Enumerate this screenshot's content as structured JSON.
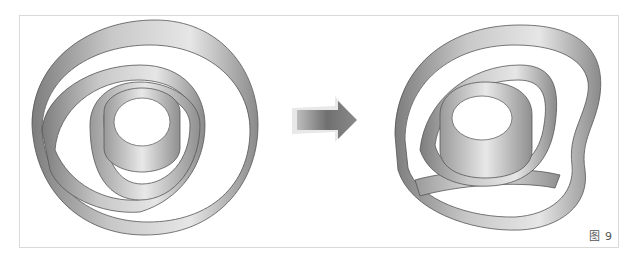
{
  "figure": {
    "caption": "图 9",
    "left_panel": {
      "description": "spiral ribbon, concentric circular form (before)"
    },
    "arrow": {
      "icon": "right-arrow-icon",
      "color": "#777777"
    },
    "right_panel": {
      "description": "spiral ribbon, deformed outer loop (after)"
    },
    "colors": {
      "ribbon_light": "#e2e2e2",
      "ribbon_dark": "#8c8c8c",
      "edge": "#555555",
      "frame": "#d9d9d9"
    }
  }
}
